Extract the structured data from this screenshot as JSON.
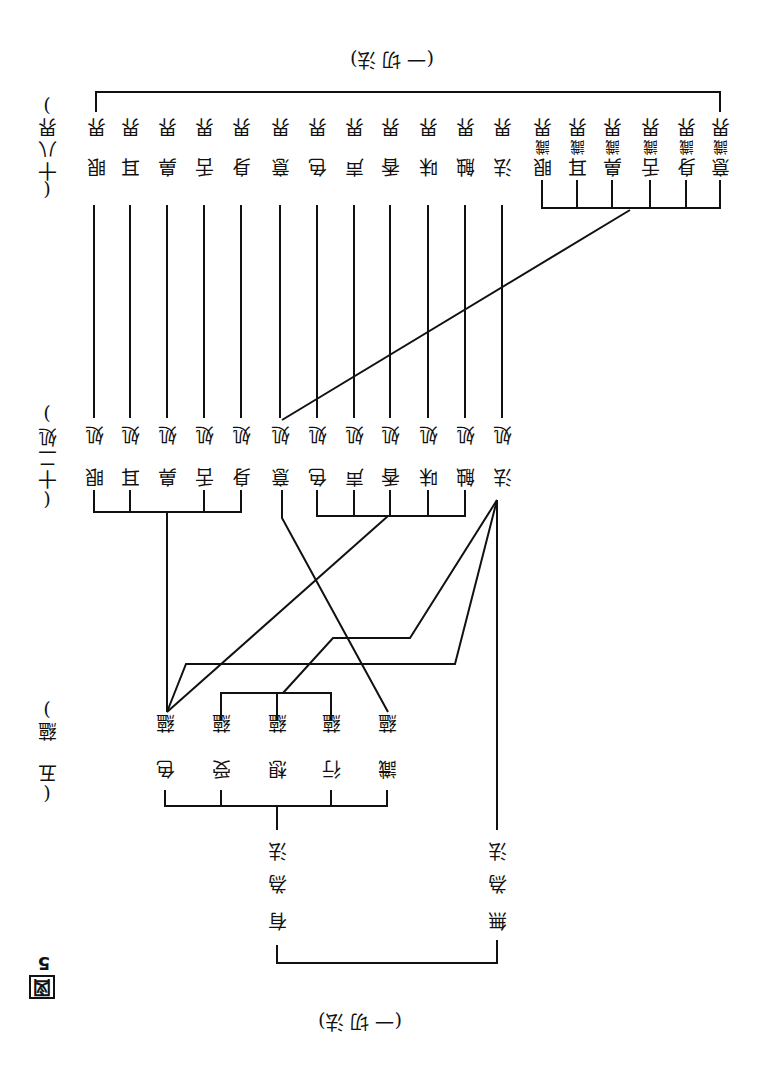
{
  "figure": {
    "label": "図",
    "number": "5"
  },
  "root_bottom": {
    "label": "(一 切 法)"
  },
  "root_top": {
    "label": "(一 切 法)"
  },
  "dharma_types": [
    {
      "name": "有為法",
      "chars": [
        "有",
        "為",
        "法"
      ]
    },
    {
      "name": "無為法",
      "chars": [
        "無",
        "為",
        "法"
      ]
    }
  ],
  "five_aggregates": {
    "heading": "(五蘊)",
    "heading_chars": [
      "(",
      "五",
      "蘊",
      ")"
    ],
    "items": [
      {
        "name": "色蘊",
        "chars": [
          "色",
          "蘊"
        ]
      },
      {
        "name": "受蘊",
        "chars": [
          "受",
          "蘊"
        ]
      },
      {
        "name": "想蘊",
        "chars": [
          "想",
          "蘊"
        ]
      },
      {
        "name": "行蘊",
        "chars": [
          "行",
          "蘊"
        ]
      },
      {
        "name": "識蘊",
        "chars": [
          "識",
          "蘊"
        ]
      }
    ]
  },
  "twelve_bases": {
    "heading": "(十二処)",
    "heading_chars": [
      "(",
      "十",
      "二",
      "処",
      ")"
    ],
    "items": [
      {
        "name": "眼処",
        "chars": [
          "眼",
          "処"
        ]
      },
      {
        "name": "耳処",
        "chars": [
          "耳",
          "処"
        ]
      },
      {
        "name": "鼻処",
        "chars": [
          "鼻",
          "処"
        ]
      },
      {
        "name": "舌処",
        "chars": [
          "舌",
          "処"
        ]
      },
      {
        "name": "身処",
        "chars": [
          "身",
          "処"
        ]
      },
      {
        "name": "意処",
        "chars": [
          "意",
          "処"
        ]
      },
      {
        "name": "色処",
        "chars": [
          "色",
          "処"
        ]
      },
      {
        "name": "声処",
        "chars": [
          "声",
          "処"
        ]
      },
      {
        "name": "香処",
        "chars": [
          "香",
          "処"
        ]
      },
      {
        "name": "味処",
        "chars": [
          "味",
          "処"
        ]
      },
      {
        "name": "触処",
        "chars": [
          "触",
          "処"
        ]
      },
      {
        "name": "法処",
        "chars": [
          "法",
          "処"
        ]
      }
    ]
  },
  "eighteen_elements": {
    "heading": "(十八界)",
    "heading_chars": [
      "(",
      "十",
      "八",
      "界",
      ")"
    ],
    "items": [
      {
        "name": "眼界",
        "chars": [
          "眼",
          "界"
        ]
      },
      {
        "name": "耳界",
        "chars": [
          "耳",
          "界"
        ]
      },
      {
        "name": "鼻界",
        "chars": [
          "鼻",
          "界"
        ]
      },
      {
        "name": "舌界",
        "chars": [
          "舌",
          "界"
        ]
      },
      {
        "name": "身界",
        "chars": [
          "身",
          "界"
        ]
      },
      {
        "name": "意界",
        "chars": [
          "意",
          "界"
        ]
      },
      {
        "name": "色界",
        "chars": [
          "色",
          "界"
        ]
      },
      {
        "name": "声界",
        "chars": [
          "声",
          "界"
        ]
      },
      {
        "name": "香界",
        "chars": [
          "香",
          "界"
        ]
      },
      {
        "name": "味界",
        "chars": [
          "味",
          "界"
        ]
      },
      {
        "name": "触界",
        "chars": [
          "触",
          "界"
        ]
      },
      {
        "name": "法界",
        "chars": [
          "法",
          "界"
        ]
      },
      {
        "name": "眼識界",
        "chars": [
          "眼",
          "識",
          "界"
        ]
      },
      {
        "name": "耳識界",
        "chars": [
          "耳",
          "識",
          "界"
        ]
      },
      {
        "name": "鼻識界",
        "chars": [
          "鼻",
          "識",
          "界"
        ]
      },
      {
        "name": "舌識界",
        "chars": [
          "舌",
          "識",
          "界"
        ]
      },
      {
        "name": "身識界",
        "chars": [
          "身",
          "識",
          "界"
        ]
      },
      {
        "name": "意識界",
        "chars": [
          "意",
          "識",
          "界"
        ]
      }
    ]
  },
  "colors": {
    "ink": "#111111",
    "paper": "#ffffff"
  }
}
